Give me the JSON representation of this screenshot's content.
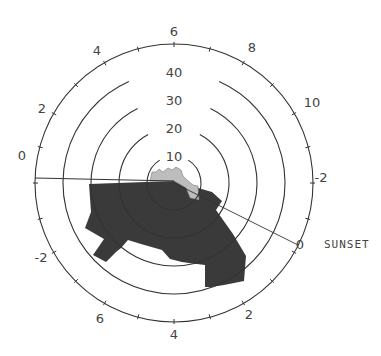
{
  "chart_data": {
    "type": "polar_area",
    "title": "",
    "center_px": [
      174,
      183
    ],
    "radial_axis": {
      "rings": [
        10,
        20,
        30,
        40
      ],
      "ring_labels": [
        "10",
        "20",
        "30",
        "40"
      ],
      "max": 50,
      "ring_radii_px": [
        27,
        55,
        83,
        111
      ],
      "outer_radius_px": 139
    },
    "angular_axis": {
      "description": "Hours relative to reference; outer ring tick labels",
      "tick_labels": [
        {
          "text": "6",
          "x": 174,
          "y": 36
        },
        {
          "text": "8",
          "x": 252,
          "y": 52
        },
        {
          "text": "10",
          "x": 312,
          "y": 107
        },
        {
          "text": "-2",
          "x": 321,
          "y": 182
        },
        {
          "text": "0",
          "x": 300,
          "y": 249
        },
        {
          "text": "2",
          "x": 249,
          "y": 319
        },
        {
          "text": "4",
          "x": 174,
          "y": 339
        },
        {
          "text": "6",
          "x": 100,
          "y": 323
        },
        {
          "text": "-2",
          "x": 41,
          "y": 262
        },
        {
          "text": "0",
          "x": 22,
          "y": 160
        },
        {
          "text": "2",
          "x": 42,
          "y": 113
        },
        {
          "text": "4",
          "x": 97,
          "y": 55
        }
      ],
      "annotations": [
        {
          "text": "SUNSET",
          "x": 324,
          "y": 248
        }
      ]
    },
    "reference_lines": [
      {
        "name": "zero-line-left",
        "from": [
          174,
          181
        ],
        "to": [
          35,
          178
        ]
      },
      {
        "name": "sunset-line",
        "from": [
          174,
          183
        ],
        "to": [
          298,
          245
        ]
      }
    ],
    "series": [
      {
        "name": "dark-sector",
        "fill": "#3a3a3a",
        "description": "Large dark hatched area spanning from left (0) around bottom to sunset; radius approx 30-45",
        "approx_polygon_px": [
          [
            89,
            184
          ],
          [
            174,
            181
          ],
          [
            212,
            192
          ],
          [
            222,
            201
          ],
          [
            216,
            210
          ],
          [
            233,
            234
          ],
          [
            246,
            256
          ],
          [
            244,
            281
          ],
          [
            224,
            285
          ],
          [
            211,
            287
          ],
          [
            205,
            287
          ],
          [
            205,
            265
          ],
          [
            189,
            263
          ],
          [
            182,
            262
          ],
          [
            170,
            259
          ],
          [
            162,
            250
          ],
          [
            141,
            244
          ],
          [
            128,
            240
          ],
          [
            121,
            248
          ],
          [
            116,
            252
          ],
          [
            106,
            262
          ],
          [
            93,
            255
          ],
          [
            104,
            239
          ],
          [
            85,
            228
          ],
          [
            91,
            212
          ]
        ]
      },
      {
        "name": "light-sector",
        "fill": "#bdbdbd",
        "description": "Small light gray area near center, radius approx 8-12",
        "approx_polygon_px": [
          [
            150,
            181
          ],
          [
            152,
            172
          ],
          [
            156,
            172
          ],
          [
            159,
            169
          ],
          [
            163,
            172
          ],
          [
            168,
            168
          ],
          [
            172,
            170
          ],
          [
            176,
            167
          ],
          [
            181,
            170
          ],
          [
            183,
            176
          ],
          [
            187,
            180
          ],
          [
            193,
            185
          ],
          [
            198,
            186
          ],
          [
            199,
            200
          ],
          [
            190,
            198
          ],
          [
            186,
            188
          ],
          [
            174,
            181
          ]
        ]
      }
    ]
  }
}
